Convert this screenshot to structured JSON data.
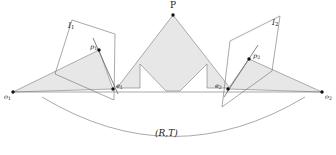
{
  "figure": {
    "caption_label": "(R,T)",
    "colors": {
      "shade_fill": "#e7e7e7",
      "stroke": "#4a4a4a",
      "point": "#111111",
      "background": "#ffffff"
    }
  },
  "labels": {
    "scene_point": "P",
    "image_plane_left": "I",
    "image_plane_left_sub": "1",
    "image_plane_right": "I",
    "image_plane_right_sub": "2",
    "image_point_left": "p",
    "image_point_left_sub": "1",
    "image_point_right": "p",
    "image_point_right_sub": "2",
    "epipole_left": "e",
    "epipole_left_sub": "1",
    "epipole_right": "e",
    "epipole_right_sub": "2",
    "camera_center_left": "o",
    "camera_center_left_sub": "1",
    "camera_center_right": "o",
    "camera_center_right_sub": "2",
    "transform": "(R,T)"
  },
  "geometry": {
    "points": {
      "P": [
        173,
        13
      ],
      "o1": [
        13,
        92
      ],
      "o2": [
        322,
        92
      ],
      "p1": [
        99,
        50
      ],
      "p2": [
        249,
        59
      ],
      "e1": [
        113,
        89
      ],
      "e2": [
        228,
        89
      ]
    },
    "baseline": {
      "from": "o1",
      "to": "o2",
      "y": 92
    },
    "arc": {
      "x1": 42,
      "y1": 97,
      "x2": 305,
      "y2": 97,
      "sag": 48
    }
  }
}
